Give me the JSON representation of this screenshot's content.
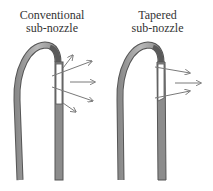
{
  "panels": [
    {
      "id": "conventional",
      "title_line1": "Conventional",
      "title_line2": "sub-nozzle",
      "jet_pattern": "diverging"
    },
    {
      "id": "tapered",
      "title_line1": "Tapered",
      "title_line2": "sub-nozzle",
      "jet_pattern": "converging"
    }
  ],
  "colors": {
    "tube_fill": "#a6a6a6",
    "tube_dark": "#6e6e6e",
    "outline": "#555555",
    "arrow": "#7a7a7a",
    "outlet": "#ffffff"
  }
}
